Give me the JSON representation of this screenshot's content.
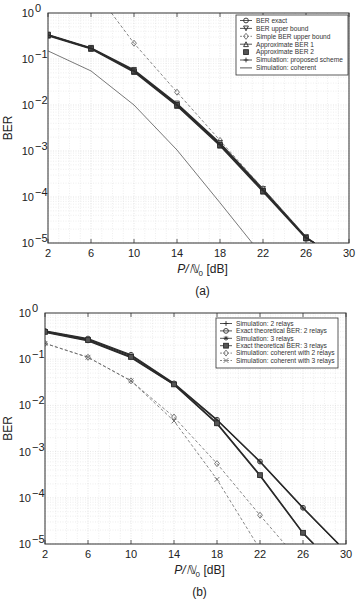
{
  "chart_data": [
    {
      "id": "a",
      "type": "line",
      "caption": "(a)",
      "title": "",
      "xlabel": "P/N0 [dB]",
      "ylabel": "BER",
      "xlim": [
        2,
        30
      ],
      "ylim": [
        1e-05,
        1
      ],
      "yscale": "log",
      "xticks": [
        2,
        6,
        10,
        14,
        18,
        22,
        26,
        30
      ],
      "yticks": [
        "10^0",
        "10^-1",
        "10^-2",
        "10^-3",
        "10^-4",
        "10^-5"
      ],
      "grid": true,
      "legend_position": "upper right",
      "series": [
        {
          "name": "BER exact",
          "marker": "o",
          "style": "solid",
          "x": [
            2,
            6,
            10,
            14,
            18,
            22,
            26,
            26.8
          ],
          "y": [
            0.33,
            0.17,
            0.055,
            0.0102,
            0.0014,
            0.00014,
            1.3e-05,
            1e-05
          ]
        },
        {
          "name": "BER upper bound",
          "marker": "v",
          "style": "solid",
          "x": [
            2,
            6,
            10,
            14,
            18,
            22,
            26,
            26.8
          ],
          "y": [
            0.34,
            0.175,
            0.058,
            0.0108,
            0.0015,
            0.00015,
            1.35e-05,
            1e-05
          ]
        },
        {
          "name": "Simple BER upper bound",
          "marker": "d",
          "style": "dashed",
          "x": [
            7.9,
            10,
            14,
            18,
            22,
            26,
            26.8
          ],
          "y": [
            1.0,
            0.22,
            0.019,
            0.0017,
            0.000152,
            1.35e-05,
            1e-05
          ]
        },
        {
          "name": "Approximate BER 1",
          "marker": "^",
          "style": "solid",
          "x": [
            2,
            6,
            10,
            14,
            18,
            22,
            26,
            26.8
          ],
          "y": [
            0.32,
            0.165,
            0.052,
            0.0095,
            0.0013,
            0.00013,
            1.25e-05,
            1e-05
          ]
        },
        {
          "name": "Approximate BER 2",
          "marker": "s",
          "style": "none",
          "x": [
            2,
            6,
            10,
            14,
            18,
            22,
            26
          ],
          "y": [
            0.33,
            0.17,
            0.054,
            0.01,
            0.00135,
            0.000135,
            1.28e-05
          ]
        },
        {
          "name": "Simulation: proposed scheme",
          "marker": "+",
          "style": "solid",
          "x": [
            2,
            6,
            10,
            14,
            18,
            22,
            26,
            26.8
          ],
          "y": [
            0.33,
            0.17,
            0.055,
            0.01,
            0.00138,
            0.00014,
            1.3e-05,
            1e-05
          ]
        },
        {
          "name": "Simulation: coherent",
          "marker": "none",
          "style": "solid",
          "x": [
            2,
            6,
            10,
            14,
            18,
            21.0
          ],
          "y": [
            0.15,
            0.055,
            0.01,
            0.00105,
            7.5e-05,
            1e-05
          ]
        }
      ]
    },
    {
      "id": "b",
      "type": "line",
      "caption": "(b)",
      "title": "",
      "xlabel": "P/N0 [dB]",
      "ylabel": "BER",
      "xlim": [
        2,
        30
      ],
      "ylim": [
        1e-05,
        1
      ],
      "yscale": "log",
      "xticks": [
        2,
        6,
        10,
        14,
        18,
        22,
        26,
        30
      ],
      "yticks": [
        "10^0",
        "10^-1",
        "10^-2",
        "10^-3",
        "10^-4",
        "10^-5"
      ],
      "grid": true,
      "legend_position": "upper right",
      "series": [
        {
          "name": "Simulation: 2 relays",
          "marker": "+",
          "style": "solid",
          "x": [
            2,
            6,
            10,
            14,
            18,
            22,
            26,
            29.3
          ],
          "y": [
            0.4,
            0.27,
            0.12,
            0.029,
            0.0048,
            0.0006,
            6e-05,
            1e-05
          ]
        },
        {
          "name": "Exact theoretical BER: 2 relays",
          "marker": "o",
          "style": "solid",
          "x": [
            2,
            6,
            10,
            14,
            18,
            22,
            26,
            29.3
          ],
          "y": [
            0.41,
            0.28,
            0.125,
            0.03,
            0.0049,
            0.00061,
            6.1e-05,
            1e-05
          ]
        },
        {
          "name": "Simulation: 3 relays",
          "marker": "*",
          "style": "solid",
          "x": [
            2,
            6,
            10,
            14,
            18,
            22,
            26,
            27.0
          ],
          "y": [
            0.38,
            0.25,
            0.108,
            0.028,
            0.004,
            0.0003,
            1.7e-05,
            1e-05
          ]
        },
        {
          "name": "Exact theoretical BER: 3 relays",
          "marker": "s",
          "style": "solid",
          "x": [
            2,
            6,
            10,
            14,
            18,
            22,
            26,
            27.0
          ],
          "y": [
            0.39,
            0.26,
            0.112,
            0.0285,
            0.0041,
            0.00031,
            1.75e-05,
            1e-05
          ]
        },
        {
          "name": "Simulation: coherent with 2 relays",
          "marker": "d",
          "style": "dashed",
          "x": [
            2,
            6,
            10,
            14,
            18,
            22,
            24.3
          ],
          "y": [
            0.22,
            0.11,
            0.034,
            0.0056,
            0.00055,
            4.2e-05,
            1e-05
          ]
        },
        {
          "name": "Simulation: coherent with 3 relays",
          "marker": "x",
          "style": "dashed",
          "x": [
            2,
            6,
            10,
            14,
            18,
            21.7
          ],
          "y": [
            0.22,
            0.11,
            0.034,
            0.0046,
            0.00025,
            1e-05
          ]
        }
      ]
    }
  ],
  "figures": {
    "a": {
      "caption": "(a)",
      "ylabel": "BER",
      "xlabel_main": "P/",
      "xlabel_sym": "ℕ",
      "xlabel_sub": "0",
      "xlabel_unit": " [dB]",
      "xticks": [
        "2",
        "6",
        "10",
        "14",
        "18",
        "22",
        "26",
        "30"
      ],
      "ytick_base": "10",
      "ytick_exps": [
        "0",
        "−1",
        "−2",
        "−3",
        "−4",
        "−5"
      ],
      "legend": [
        "BER exact",
        "BER upper bound",
        "Simple BER upper bound",
        "Approximate BER 1",
        "Approximate BER 2",
        "Simulation: proposed scheme",
        "Simulation: coherent"
      ]
    },
    "b": {
      "caption": "(b)",
      "ylabel": "BER",
      "xlabel_main": "P/",
      "xlabel_sym": "ℕ",
      "xlabel_sub": "0",
      "xlabel_unit": " [dB]",
      "xticks": [
        "2",
        "6",
        "10",
        "14",
        "18",
        "22",
        "26",
        "30"
      ],
      "ytick_base": "10",
      "ytick_exps": [
        "0",
        "−1",
        "−2",
        "−3",
        "−4",
        "−5"
      ],
      "legend": [
        "Simulation: 2 relays",
        "Exact theoretical BER: 2 relays",
        "Simulation: 3 relays",
        "Exact theoretical BER: 3 relays",
        "Simulation: coherent with 2 relays",
        "Simulation: coherent with 3 relays"
      ]
    }
  },
  "colors": {
    "axis": "#333333",
    "grid": "#d4d4d4",
    "line_dark": "#2a2a2a",
    "line_mid": "#555555",
    "dashed": "#6a6a6a"
  }
}
